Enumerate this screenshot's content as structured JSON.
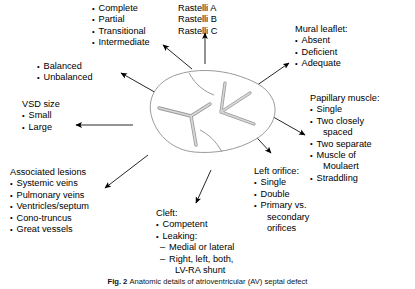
{
  "figure": {
    "title": "Anatomic details of atrioventricular (AV) septal defect",
    "caption_label": "Fig. 2",
    "caption_text": "Anatomic details of atrioventricular (AV) septal defect",
    "illustration_name": "av-septal-defect-valve-illustration",
    "line_color": "#000000",
    "illustration_stroke": "#808080",
    "illustration_fill": "#e8e8e8",
    "background": "#ffffff"
  },
  "blocks": {
    "defect_type": {
      "header": "",
      "items": [
        "Complete",
        "Partial",
        "Transitional",
        "Intermediate"
      ]
    },
    "rastelli": {
      "header": "",
      "items": [
        "Rastelli A",
        "Rastelli B",
        "Rastelli C"
      ]
    },
    "mural_leaflet": {
      "header": "Mural leaflet:",
      "items": [
        "Absent",
        "Deficient",
        "Adequate"
      ]
    },
    "balance": {
      "header": "",
      "items": [
        "Balanced",
        "Unbalanced"
      ]
    },
    "vsd_size": {
      "header": "VSD size",
      "items": [
        "Small",
        "Large"
      ]
    },
    "papillary_muscle": {
      "header": "Papillary muscle:",
      "items": [
        "Single",
        "Two closely",
        "spaced",
        "Two separate",
        "Muscle of",
        "Moulaert",
        "Straddling"
      ]
    },
    "associated_lesions": {
      "header": "Associated lesions",
      "items": [
        "Systemic veins",
        "Pulmonary veins",
        "Ventricles/septum",
        "Cono-truncus",
        "Great vessels"
      ]
    },
    "left_orifice": {
      "header": "Left orifice:",
      "items": [
        "Single",
        "Double",
        "Primary vs.",
        "secondary",
        "orifices"
      ]
    },
    "cleft": {
      "header": "Cleft:",
      "items": [
        "Competent",
        "Leaking:",
        "Medial or lateral",
        "Right, left, both,",
        "LV-RA shunt"
      ]
    }
  }
}
